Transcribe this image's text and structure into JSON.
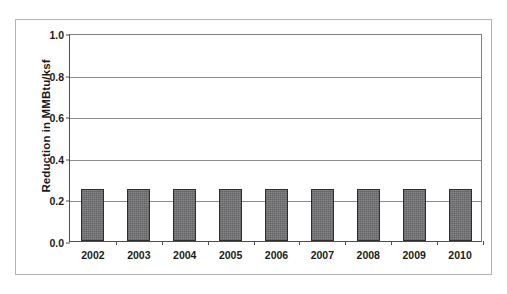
{
  "chart_data": {
    "type": "bar",
    "title": "",
    "xlabel": "",
    "ylabel": "Reduction in MMBtu/ksf",
    "categories": [
      "2002",
      "2003",
      "2004",
      "2005",
      "2006",
      "2007",
      "2008",
      "2009",
      "2010"
    ],
    "values": [
      0.25,
      0.25,
      0.25,
      0.25,
      0.25,
      0.25,
      0.25,
      0.25,
      0.25
    ],
    "series": [
      {
        "name": "Reduction",
        "values": [
          0.25,
          0.25,
          0.25,
          0.25,
          0.25,
          0.25,
          0.25,
          0.25,
          0.25
        ]
      }
    ],
    "ylim": [
      0.0,
      1.0
    ],
    "ytick_labels": [
      "0.0",
      "0.2",
      "0.4",
      "0.6",
      "0.8",
      "1.0"
    ],
    "ytick_values": [
      0.0,
      0.2,
      0.4,
      0.6,
      0.8,
      1.0
    ],
    "grid": true,
    "grid_axis": "y",
    "legend": false,
    "legend_position": "none",
    "bar_color": "#77777a",
    "bar_edge_color": "#2e2e2e",
    "axis_color": "#4d4d4d",
    "gridline_color": "#8c8c8c",
    "plot_background": "#ffffff",
    "frame_border_color": "#b3b3b3"
  }
}
